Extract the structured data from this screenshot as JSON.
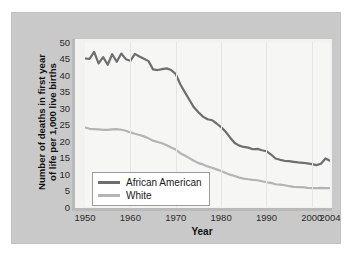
{
  "chart_data": {
    "type": "line",
    "title": "",
    "xlabel": "Year",
    "ylabel": "Number of deaths in first year of life per 1,000 live births",
    "xlim": [
      1950,
      2004
    ],
    "ylim": [
      0,
      50
    ],
    "xticks": [
      1950,
      1960,
      1970,
      1980,
      1990,
      2000,
      2004
    ],
    "xtick_labels": [
      "1950",
      "1960",
      "1970",
      "1980",
      "1990",
      "2000",
      "2004"
    ],
    "yticks": [
      0,
      5,
      10,
      15,
      20,
      25,
      30,
      35,
      40,
      45,
      50
    ],
    "ytick_labels": [
      "0",
      "5",
      "10",
      "15",
      "20",
      "25",
      "30",
      "35",
      "40",
      "45",
      "50"
    ],
    "grid": "vertical-only",
    "legend_position": "lower-left-inside",
    "x": [
      1950,
      1951,
      1952,
      1953,
      1954,
      1955,
      1956,
      1957,
      1958,
      1959,
      1960,
      1961,
      1962,
      1963,
      1964,
      1965,
      1966,
      1967,
      1968,
      1969,
      1970,
      1971,
      1972,
      1973,
      1974,
      1975,
      1976,
      1977,
      1978,
      1979,
      1980,
      1981,
      1982,
      1983,
      1984,
      1985,
      1986,
      1987,
      1988,
      1989,
      1990,
      1991,
      1992,
      1993,
      1994,
      1995,
      1996,
      1997,
      1998,
      1999,
      2000,
      2001,
      2002,
      2003,
      2004
    ],
    "series": [
      {
        "name": "African American",
        "color": "#6e6e6e",
        "values": [
          45.0,
          44.9,
          47.0,
          43.5,
          45.4,
          43.1,
          46.3,
          44.0,
          46.5,
          44.8,
          44.3,
          46.4,
          45.6,
          44.9,
          44.2,
          41.7,
          41.5,
          41.8,
          42.0,
          41.5,
          40.3,
          37.2,
          34.8,
          32.5,
          30.2,
          28.7,
          27.4,
          26.6,
          26.3,
          25.3,
          24.2,
          22.8,
          21.0,
          19.4,
          18.6,
          18.2,
          18.0,
          17.5,
          17.6,
          17.2,
          16.9,
          15.9,
          14.7,
          14.3,
          14.0,
          13.9,
          13.7,
          13.5,
          13.4,
          13.2,
          13.0,
          12.7,
          13.1,
          14.7,
          14.0
        ]
      },
      {
        "name": "White",
        "color": "#b4b4b4",
        "values": [
          24.1,
          23.7,
          23.6,
          23.5,
          23.4,
          23.4,
          23.5,
          23.6,
          23.4,
          23.1,
          22.6,
          22.2,
          21.8,
          21.4,
          20.8,
          20.1,
          19.7,
          19.3,
          18.7,
          18.0,
          17.4,
          16.3,
          15.6,
          14.8,
          14.0,
          13.3,
          12.9,
          12.3,
          11.9,
          11.4,
          10.9,
          10.3,
          9.8,
          9.4,
          8.9,
          8.6,
          8.4,
          8.2,
          8.1,
          7.8,
          7.5,
          7.3,
          6.9,
          6.8,
          6.6,
          6.3,
          6.1,
          6.0,
          6.0,
          5.8,
          5.7,
          5.7,
          5.8,
          5.7,
          5.7
        ]
      }
    ]
  },
  "legend": {
    "items": [
      {
        "label": "African American",
        "color": "#6e6e6e"
      },
      {
        "label": "White",
        "color": "#b4b4b4"
      }
    ]
  },
  "axes": {
    "x_title": "Year",
    "y_title_line1": "Number of deaths in first year",
    "y_title_line2": "of life per 1,000 live births"
  }
}
